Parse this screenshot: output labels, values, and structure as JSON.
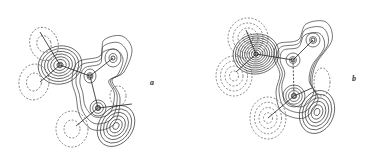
{
  "figure": {
    "panels": [
      {
        "id": "a",
        "label": "a"
      },
      {
        "id": "b",
        "label": "b"
      }
    ],
    "legend": {
      "solid_lines": "positive contours",
      "dashed_lines": "negative contours"
    },
    "colors": {
      "line": "#3a3a3a",
      "background": "#ffffff"
    }
  }
}
